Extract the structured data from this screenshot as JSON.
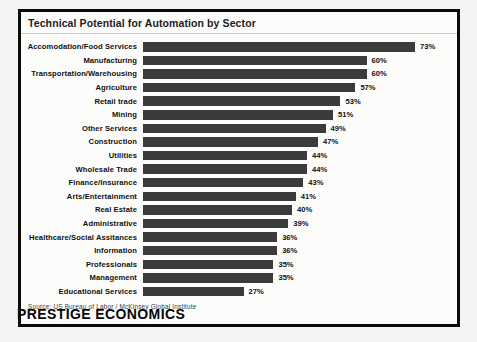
{
  "chart_data": {
    "type": "bar",
    "orientation": "horizontal",
    "title": "Technical Potential for Automation by Sector",
    "categories": [
      "Accomodation/Food Services",
      "Manufacturing",
      "Transportation/Warehousing",
      "Agriculture",
      "Retail trade",
      "Mining",
      "Other Services",
      "Construction",
      "Utilities",
      "Wholesale Trade",
      "Finance/Insurance",
      "Arts/Entertainment",
      "Real Estate",
      "Administrative",
      "Healthcare/Social Assitances",
      "Information",
      "Professionals",
      "Management",
      "Educational Services"
    ],
    "values": [
      73,
      60,
      60,
      57,
      53,
      51,
      49,
      47,
      44,
      44,
      43,
      41,
      40,
      39,
      36,
      36,
      35,
      35,
      27
    ],
    "value_suffix": "%",
    "xlim": [
      0,
      80
    ],
    "grid": false,
    "legend": false,
    "bar_color": "#3b3b3b"
  },
  "source": {
    "label": "Source:  US Bureau of Labor / McKinsey Global Institute"
  },
  "brand": {
    "name": "PRESTIGE ECONOMICS"
  },
  "colors": {
    "bar": "#3b3b3b",
    "frame_border": "#0b0b0b",
    "background": "#f4f4f2",
    "text": "#111111"
  }
}
